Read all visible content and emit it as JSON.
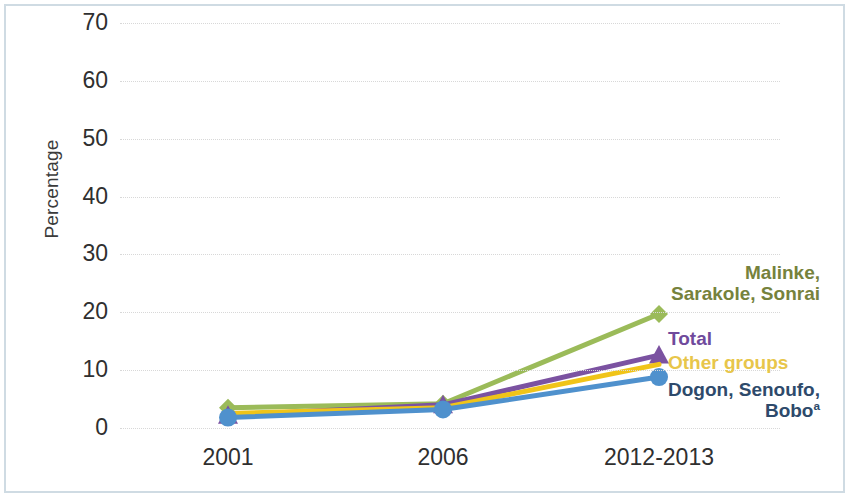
{
  "figure": {
    "border_color": "#cfdbe3",
    "background": "#ffffff"
  },
  "axes": {
    "y_title": "Percentage",
    "y_ticks": [
      "70",
      "60",
      "50",
      "40",
      "30",
      "20",
      "10",
      "0"
    ],
    "x_ticks": [
      "2001",
      "2006",
      "2012-2013"
    ]
  },
  "labels": {
    "malinke_line1": "Malinke,",
    "malinke_line2": "Sarakole, Sonrai",
    "total": "Total",
    "other_groups": "Other groups",
    "dogon_line1": "Dogon, Senoufo,",
    "dogon_line2": "Bobo",
    "dogon_footnote": "a"
  },
  "chart_data": {
    "type": "line",
    "title": "",
    "xlabel": "",
    "ylabel": "Percentage",
    "categories": [
      "2001",
      "2006",
      "2012-2013"
    ],
    "ylim": [
      0,
      70
    ],
    "ytick_step": 10,
    "grid": true,
    "legend_position": "inline-right",
    "series": [
      {
        "name": "Malinke, Sarakole, Sonrai",
        "values": [
          3.5,
          4.2,
          19.7
        ],
        "color": "#9bbb59",
        "label_color": "#76823c",
        "marker": "diamond"
      },
      {
        "name": "Total",
        "values": [
          2.2,
          4.0,
          12.6
        ],
        "color": "#7b52a1",
        "label_color": "#6f4a9c",
        "marker": "triangle"
      },
      {
        "name": "Other groups",
        "values": [
          2.5,
          3.5,
          11.0
        ],
        "color": "#f0c419",
        "label_color": "#e8c64a",
        "marker": "none"
      },
      {
        "name": "Dogon, Senoufo, Bobo",
        "values": [
          1.8,
          3.2,
          8.8
        ],
        "color": "#4f91cd",
        "label_color": "#2e4a6b",
        "marker": "circle"
      }
    ]
  }
}
